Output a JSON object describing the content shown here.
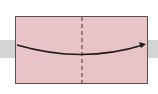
{
  "diagram": {
    "type": "origami-fold-instruction",
    "paper": {
      "color": "#e8c3c8",
      "border_color": "#5a5055"
    },
    "background_band": {
      "color": "#d4d4d4"
    },
    "fold_line": {
      "style": "dashed",
      "orientation": "vertical",
      "color": "#7a4a55"
    },
    "arrow": {
      "direction": "left-to-right",
      "shape": "curved",
      "color": "#1a1a1a"
    }
  }
}
